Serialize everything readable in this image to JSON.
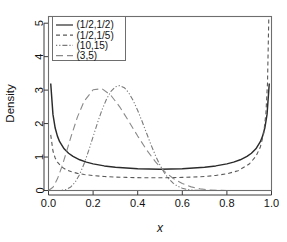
{
  "chart_data": {
    "type": "line",
    "title": "",
    "xlabel": "x",
    "ylabel": "Density",
    "xlim": [
      0.0,
      1.0
    ],
    "ylim": [
      0.0,
      5.2
    ],
    "grid": false,
    "legend_position": "top-left",
    "xticks": [
      "0.0",
      "0.2",
      "0.4",
      "0.6",
      "0.8",
      "1.0"
    ],
    "xtick_values": [
      0.0,
      0.2,
      0.4,
      0.6,
      0.8,
      1.0
    ],
    "yticks": [
      "0",
      "1",
      "2",
      "3",
      "4",
      "5"
    ],
    "ytick_values": [
      0,
      1,
      2,
      3,
      4,
      5
    ],
    "series": [
      {
        "name": "(1/2,1/2)",
        "linestyle": "solid",
        "color": "#2b2b2b",
        "params": {
          "alpha": 0.5,
          "beta": 0.5
        },
        "x": [
          0.01,
          0.02,
          0.03,
          0.04,
          0.05,
          0.07,
          0.09,
          0.11,
          0.14,
          0.17,
          0.2,
          0.25,
          0.3,
          0.35,
          0.4,
          0.45,
          0.5,
          0.55,
          0.6,
          0.65,
          0.7,
          0.75,
          0.8,
          0.83,
          0.86,
          0.89,
          0.91,
          0.93,
          0.95,
          0.96,
          0.97,
          0.98,
          0.99
        ],
        "y": [
          3.198,
          2.274,
          1.866,
          1.625,
          1.46,
          1.247,
          1.114,
          1.02,
          0.918,
          0.848,
          0.796,
          0.735,
          0.695,
          0.67,
          0.65,
          0.64,
          0.637,
          0.64,
          0.65,
          0.67,
          0.695,
          0.735,
          0.796,
          0.848,
          0.918,
          1.02,
          1.114,
          1.247,
          1.46,
          1.625,
          1.866,
          2.274,
          3.198
        ]
      },
      {
        "name": "(1/2,1/5)",
        "linestyle": "dashed",
        "color": "#5a5a5a",
        "params": {
          "alpha": 0.5,
          "beta": 0.2
        },
        "x": [
          0.01,
          0.02,
          0.03,
          0.04,
          0.06,
          0.08,
          0.1,
          0.13,
          0.16,
          0.2,
          0.25,
          0.3,
          0.35,
          0.4,
          0.45,
          0.5,
          0.55,
          0.6,
          0.65,
          0.7,
          0.75,
          0.8,
          0.85,
          0.9,
          0.93,
          0.95,
          0.965,
          0.975,
          0.982,
          0.988
        ],
        "y": [
          1.66,
          1.18,
          0.97,
          0.845,
          0.7,
          0.618,
          0.566,
          0.512,
          0.477,
          0.446,
          0.419,
          0.402,
          0.391,
          0.384,
          0.381,
          0.381,
          0.384,
          0.391,
          0.402,
          0.42,
          0.45,
          0.5,
          0.59,
          0.79,
          1.02,
          1.3,
          1.7,
          2.3,
          3.2,
          5.2
        ]
      },
      {
        "name": "(10,15)",
        "linestyle": "dashdot",
        "color": "#7a7a7a",
        "params": {
          "alpha": 10,
          "beta": 15
        },
        "x": [
          0.06,
          0.08,
          0.1,
          0.12,
          0.14,
          0.16,
          0.18,
          0.2,
          0.22,
          0.24,
          0.26,
          0.28,
          0.3,
          0.32,
          0.34,
          0.36,
          0.38,
          0.4,
          0.42,
          0.44,
          0.46,
          0.48,
          0.5,
          0.52,
          0.54,
          0.56,
          0.58,
          0.6,
          0.62,
          0.64,
          0.66,
          0.7,
          0.74,
          0.8
        ],
        "y": [
          0.006,
          0.032,
          0.105,
          0.252,
          0.486,
          0.805,
          1.19,
          1.609,
          2.027,
          2.41,
          2.729,
          2.963,
          3.1,
          3.136,
          3.073,
          2.918,
          2.686,
          2.393,
          2.06,
          1.709,
          1.362,
          1.039,
          0.756,
          0.524,
          0.344,
          0.213,
          0.124,
          0.068,
          0.035,
          0.016,
          0.007,
          0.001,
          0.0,
          0.0
        ]
      },
      {
        "name": "(3,5)",
        "linestyle": "longdash",
        "color": "#8a8a8a",
        "params": {
          "alpha": 3,
          "beta": 5
        },
        "x": [
          0.0,
          0.02,
          0.04,
          0.06,
          0.08,
          0.1,
          0.13,
          0.16,
          0.2,
          0.24,
          0.28,
          0.32,
          0.36,
          0.4,
          0.44,
          0.48,
          0.52,
          0.56,
          0.6,
          0.64,
          0.68,
          0.72,
          0.76,
          0.8,
          0.85,
          0.9,
          0.95,
          1.0
        ],
        "y": [
          0.0,
          0.095,
          0.348,
          0.712,
          1.14,
          1.587,
          2.2,
          2.671,
          3.01,
          3.043,
          2.842,
          2.494,
          2.069,
          1.626,
          1.212,
          0.855,
          0.57,
          0.357,
          0.207,
          0.108,
          0.049,
          0.018,
          0.005,
          0.001,
          0.0,
          0.0,
          0.0,
          0.0
        ]
      }
    ],
    "legend_entries": [
      {
        "label": "(1/2,1/2)",
        "linestyle": "solid"
      },
      {
        "label": "(1/2,1/5)",
        "linestyle": "dashed"
      },
      {
        "label": "(10,15)",
        "linestyle": "dashdot"
      },
      {
        "label": "(3,5)",
        "linestyle": "longdash"
      }
    ]
  }
}
